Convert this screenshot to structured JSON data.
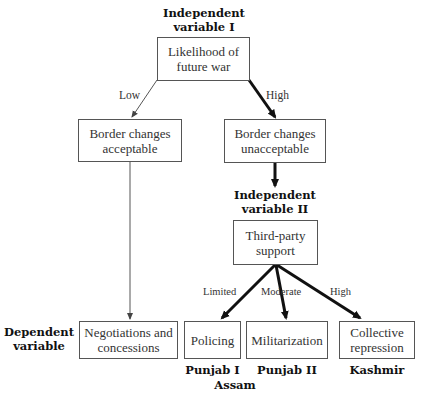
{
  "diagram": {
    "headers": {
      "independent_1": "Independent\nvariable I",
      "independent_2": "Independent\nvariable II",
      "dependent": "Dependent\nvariable"
    },
    "nodes": {
      "likelihood": "Likelihood of\nfuture war",
      "acceptable": "Border changes\nacceptable",
      "unacceptable": "Border changes\nunacceptable",
      "third_party": "Third-party\nsupport",
      "negotiations": "Negotiations and\nconcessions",
      "policing": "Policing",
      "militarization": "Militarization",
      "repression": "Collective\nrepression"
    },
    "edge_labels": {
      "low": "Low",
      "high_1": "High",
      "limited": "Limited",
      "moderate": "Moderate",
      "high_2": "High"
    },
    "cases": {
      "policing": "Punjab I",
      "militarization": "Punjab II",
      "repression": "Kashmir",
      "assam": "Assam"
    }
  }
}
